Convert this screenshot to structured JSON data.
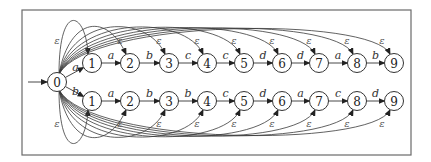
{
  "diagram": {
    "type": "nondeterministic finite automaton",
    "frame": {
      "x": 22,
      "y": 10,
      "width": 389,
      "height": 145
    },
    "start_state": "0",
    "initial_arrow": {
      "from_x": 28,
      "to_x": 47,
      "y": 82
    },
    "epsilon_symbol": "ε",
    "node_radius": 9.5,
    "start_node": {
      "id": "0",
      "label": "0",
      "x": 57,
      "y": 82
    },
    "rows": [
      {
        "name": "top",
        "y": 63,
        "first_edge_label": "a",
        "nodes": [
          {
            "label": "1",
            "x": 92
          },
          {
            "label": "2",
            "x": 130
          },
          {
            "label": "3",
            "x": 169
          },
          {
            "label": "4",
            "x": 207
          },
          {
            "label": "5",
            "x": 244
          },
          {
            "label": "6",
            "x": 282
          },
          {
            "label": "7",
            "x": 319
          },
          {
            "label": "8",
            "x": 357
          },
          {
            "label": "9",
            "x": 394
          }
        ],
        "edge_labels": [
          "a",
          "b",
          "c",
          "c",
          "d",
          "d",
          "a",
          "b"
        ],
        "epsilon_labels": [
          "ε",
          "ε",
          "ε",
          "ε",
          "ε",
          "ε",
          "ε",
          "ε",
          "ε"
        ]
      },
      {
        "name": "bottom",
        "y": 101,
        "first_edge_label": "b",
        "nodes": [
          {
            "label": "1",
            "x": 92
          },
          {
            "label": "2",
            "x": 130
          },
          {
            "label": "3",
            "x": 169
          },
          {
            "label": "4",
            "x": 207
          },
          {
            "label": "5",
            "x": 244
          },
          {
            "label": "6",
            "x": 282
          },
          {
            "label": "7",
            "x": 319
          },
          {
            "label": "8",
            "x": 357
          },
          {
            "label": "9",
            "x": 394
          }
        ],
        "edge_labels": [
          "a",
          "b",
          "b",
          "c",
          "d",
          "a",
          "c",
          "d"
        ],
        "epsilon_labels": [
          "ε",
          "ε",
          "ε",
          "ε",
          "ε",
          "ε",
          "ε",
          "ε",
          "ε"
        ]
      }
    ],
    "colors": {
      "stroke": "#333333",
      "frame": "#6a6a6a",
      "background": "#ffffff"
    }
  }
}
